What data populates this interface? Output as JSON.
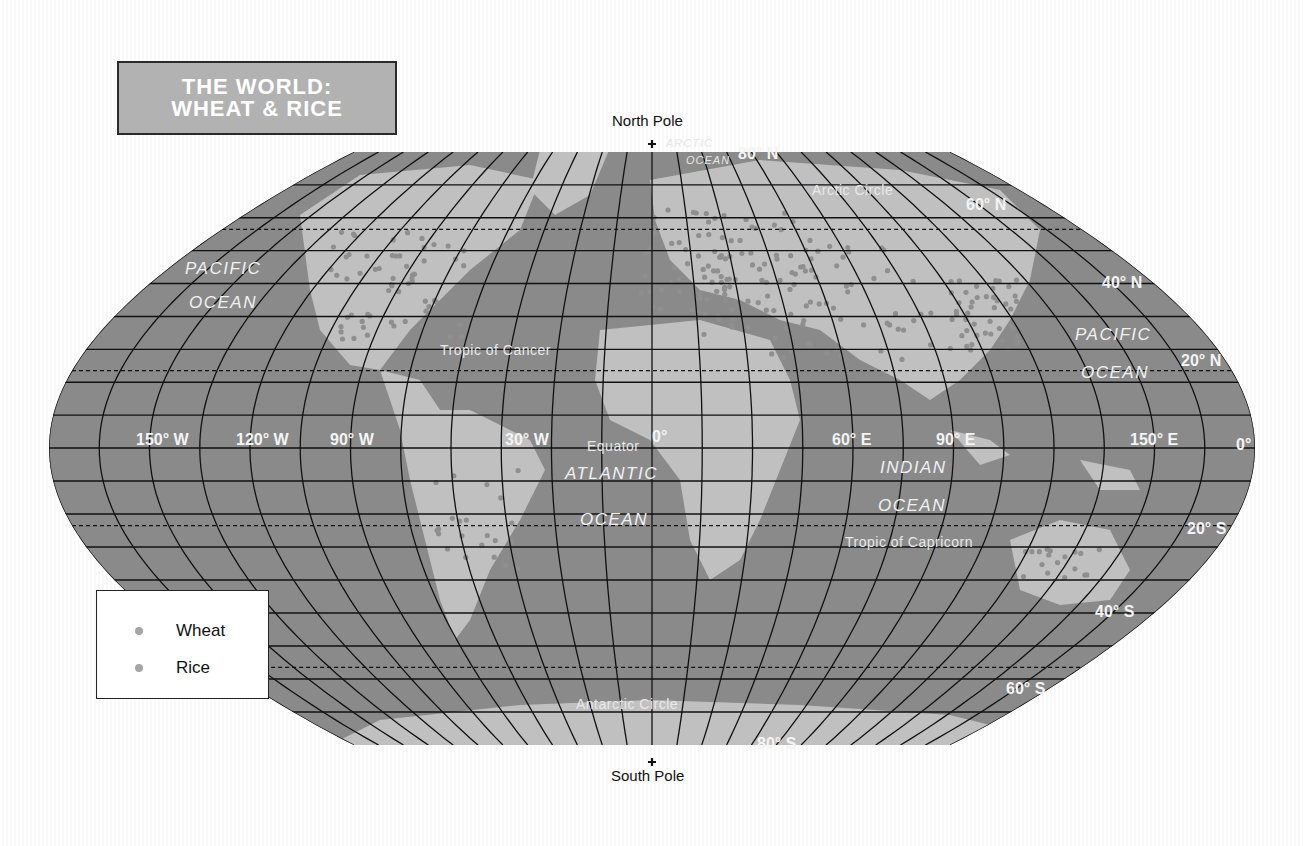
{
  "title": {
    "line1": "THE WORLD:",
    "line2": "WHEAT & RICE"
  },
  "legend": {
    "items": [
      {
        "label": "Wheat",
        "color": "#a6a6a6"
      },
      {
        "label": "Rice",
        "color": "#a6a6a6"
      }
    ]
  },
  "poles": {
    "north": "North Pole",
    "south": "South Pole"
  },
  "latitude_labels": {
    "n80": "80° N",
    "n60": "60° N",
    "n40": "40° N",
    "n20": "20° N",
    "eq": "0°",
    "s20": "20° S",
    "s40": "40° S",
    "s60": "60° S",
    "s80": "80° S"
  },
  "longitude_labels": {
    "w150": "150° W",
    "w120": "120° W",
    "w90": "90° W",
    "w30": "30° W",
    "zero": "0°",
    "e60": "60° E",
    "e90": "90° E",
    "e150": "150° E"
  },
  "special_lines": {
    "arctic_circle": "Arctic Circle",
    "tropic_cancer": "Tropic of Cancer",
    "equator": "Equator",
    "tropic_capricorn": "Tropic of Capricorn",
    "antarctic_circle": "Antarctic Circle"
  },
  "oceans": {
    "pacific_w": {
      "line1": "PACIFIC",
      "line2": "OCEAN"
    },
    "pacific_e": {
      "line1": "PACIFIC",
      "line2": "OCEAN"
    },
    "atlantic": {
      "line1": "ATLANTIC",
      "line2": "OCEAN"
    },
    "indian": {
      "line1": "INDIAN",
      "line2": "OCEAN"
    },
    "arctic": {
      "line1": "ARCTIC",
      "line2": "OCEAN"
    }
  },
  "colors": {
    "ocean": "#8a8a8a",
    "land": "#c4c4c4",
    "grid": "#111111",
    "title_bg": "#b2b2b2",
    "crop_dot": "#a6a6a6"
  },
  "projection": {
    "center_x": 652,
    "equator_y": 448,
    "half_width": 603,
    "top_y": 152,
    "bottom_y": 745,
    "parallel_step_deg": 10,
    "meridian_step_deg": 15
  }
}
